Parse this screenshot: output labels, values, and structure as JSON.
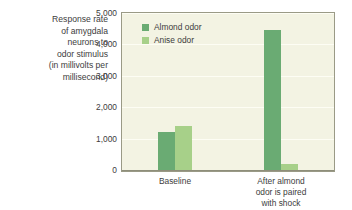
{
  "y_axis_title_lines": [
    "Response rate",
    "of amygdala",
    "neurons to",
    "odor stimulus",
    "(in millivolts per",
    "millisecond)"
  ],
  "legend": {
    "items": [
      {
        "label": "Almond odor",
        "color": "#6aab73",
        "swatch_name": "legend-swatch-almond"
      },
      {
        "label": "Anise odor",
        "color": "#a7d089",
        "swatch_name": "legend-swatch-anise"
      }
    ]
  },
  "chart_data": {
    "type": "bar",
    "title": "",
    "xlabel": "",
    "ylabel": "Response rate of amygdala neurons to odor stimulus (in millivolts per millisecond)",
    "ylim": [
      0,
      5000
    ],
    "ytick_labels": [
      "0",
      "1,000",
      "2,000",
      "3,000",
      "4,000",
      "5,000"
    ],
    "ytick_values": [
      0,
      1000,
      2000,
      3000,
      4000,
      5000
    ],
    "grid": true,
    "legend_position": "upper-left-inside",
    "categories": [
      "Baseline",
      "After almond odor is paired with shock"
    ],
    "category_label_lines": [
      [
        "Baseline"
      ],
      [
        "After almond",
        "odor is paired",
        "with shock"
      ]
    ],
    "series": [
      {
        "name": "Almond odor",
        "color": "#6aab73",
        "values": [
          1200,
          4450
        ]
      },
      {
        "name": "Anise odor",
        "color": "#a7d089",
        "values": [
          1400,
          200
        ]
      }
    ]
  },
  "colors": {
    "plot_background": "#f3f3e3",
    "plot_border": "#9a9a86",
    "gridline": "#fdfdf4",
    "page_background": "#ffffff",
    "text": "#3d3d3d"
  }
}
